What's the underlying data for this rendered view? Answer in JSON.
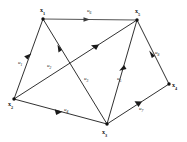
{
  "figure": {
    "title": "",
    "background_color": "#ffffff",
    "line_color": "#1a1a1a",
    "top_edge_color": "#565656",
    "label_color": "#111111"
  },
  "graph_data": {
    "type": "directed-graph",
    "node_count": 5,
    "edge_count": 8,
    "nodes": [
      {
        "id": "x1",
        "base": "x",
        "sub": "1",
        "label": "x1",
        "x": 43,
        "y": 19,
        "label_x": 40,
        "label_y": 11
      },
      {
        "id": "x5",
        "base": "x",
        "sub": "5",
        "label": "x5",
        "x": 137,
        "y": 20,
        "label_x": 135,
        "label_y": 12
      },
      {
        "id": "x2",
        "base": "x",
        "sub": "2",
        "label": "x2",
        "x": 14,
        "y": 99,
        "label_x": 10,
        "label_y": 105
      },
      {
        "id": "x3",
        "base": "x",
        "sub": "3",
        "label": "x3",
        "x": 107,
        "y": 124,
        "label_x": 104,
        "label_y": 132
      },
      {
        "id": "x4",
        "base": "x",
        "sub": "4",
        "label": "x4",
        "x": 169,
        "y": 84,
        "label_x": 172,
        "label_y": 86
      }
    ],
    "edges": [
      {
        "id": "u1",
        "base": "u",
        "sub": "1",
        "label": "u1",
        "from": "x1",
        "to": "x2",
        "label_x": 21,
        "label_y": 63
      },
      {
        "id": "u2",
        "base": "u",
        "sub": "2",
        "label": "u2",
        "from": "x2",
        "to": "x5",
        "label_x": 50,
        "label_y": 66
      },
      {
        "id": "u3",
        "base": "u",
        "sub": "3",
        "label": "u3",
        "from": "x1",
        "to": "x3",
        "label_x": 86,
        "label_y": 79
      },
      {
        "id": "u4",
        "base": "u",
        "sub": "4",
        "label": "u4",
        "from": "x2",
        "to": "x3",
        "label_x": 66,
        "label_y": 110
      },
      {
        "id": "u5",
        "base": "u",
        "sub": "5",
        "label": "u5",
        "from": "x3",
        "to": "x5",
        "label_x": 119,
        "label_y": 79
      },
      {
        "id": "u6",
        "base": "u",
        "sub": "6",
        "label": "u6",
        "from": "x1",
        "to": "x5",
        "label_x": 89,
        "label_y": 11
      },
      {
        "id": "u7",
        "base": "u",
        "sub": "7",
        "label": "u7",
        "from": "x3",
        "to": "x4",
        "label_x": 141,
        "label_y": 109
      },
      {
        "id": "u8",
        "base": "u",
        "sub": "8",
        "label": "u8",
        "from": "x5",
        "to": "x4",
        "label_x": 157,
        "label_y": 53
      }
    ]
  }
}
